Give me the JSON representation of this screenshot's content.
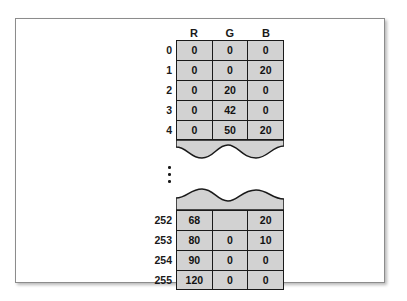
{
  "figure": {
    "panel_border_color": "#8c8c8c",
    "cell_fill_color": "#d2d2d2",
    "line_color": "#1a1a1a"
  },
  "table": {
    "column_headers": [
      "R",
      "G",
      "B"
    ],
    "top_block": [
      {
        "index": "0",
        "values": [
          "0",
          "0",
          "0"
        ]
      },
      {
        "index": "1",
        "values": [
          "0",
          "0",
          "20"
        ]
      },
      {
        "index": "2",
        "values": [
          "0",
          "20",
          "0"
        ]
      },
      {
        "index": "3",
        "values": [
          "0",
          "42",
          "0"
        ]
      },
      {
        "index": "4",
        "values": [
          "0",
          "50",
          "20"
        ]
      }
    ],
    "ellipsis": "⋮",
    "bottom_block": [
      {
        "index": "252",
        "values": [
          "68",
          "",
          "20"
        ]
      },
      {
        "index": "253",
        "values": [
          "80",
          "0",
          "10"
        ]
      },
      {
        "index": "254",
        "values": [
          "90",
          "0",
          "0"
        ]
      },
      {
        "index": "255",
        "values": [
          "120",
          "0",
          "0"
        ]
      }
    ]
  }
}
